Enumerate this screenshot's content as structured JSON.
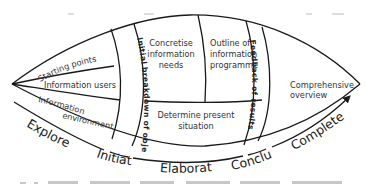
{
  "diagram": {
    "type": "lens-process-diagram",
    "regions": {
      "left_segments": [
        "Starting points",
        "Information users",
        "Information environment"
      ],
      "initiate_band": "Initial breakdown of objectives",
      "concretise": [
        "Concretise",
        "information",
        "needs"
      ],
      "outline": [
        "Outline of",
        "information",
        "programme"
      ],
      "determine": [
        "Determine present",
        "situation"
      ],
      "feedback_band": "Feedback of results",
      "comprehensive": [
        "Comprehensive",
        "overview"
      ]
    },
    "info_env_lines": [
      "Information",
      "environment"
    ],
    "phases": [
      "Explore",
      "Initiate",
      "Elaborate",
      "Conclude",
      "Complete"
    ],
    "colors": {
      "line": "#1a1a1a",
      "text": "#333333",
      "background": "#ffffff"
    }
  }
}
